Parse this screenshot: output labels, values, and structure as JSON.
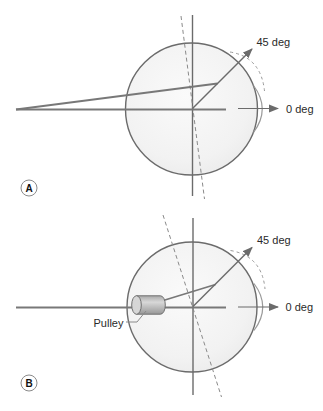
{
  "figure": {
    "type": "eye-rotation-pulley-diagram",
    "colors": {
      "background": "#ffffff",
      "globe_fill_center": "#fafafa",
      "globe_fill_edge": "#ebebeb",
      "globe_stroke": "#6b6b6b",
      "axis_line": "#6b6b6b",
      "dashed_line": "#8a8a8a",
      "muscle_line": "#787878",
      "cornea_stroke": "#9a9a9a",
      "pulley_fill": "#c2c2c2",
      "pulley_cap_fill": "#d6d6d6",
      "pulley_stroke": "#707070",
      "text": "#2a2a2a"
    },
    "panelA": {
      "badge": "A",
      "label_45": "45 deg",
      "label_0": "0 deg"
    },
    "panelB": {
      "badge": "B",
      "label_45": "45 deg",
      "label_0": "0 deg",
      "label_pulley": "Pulley"
    }
  }
}
